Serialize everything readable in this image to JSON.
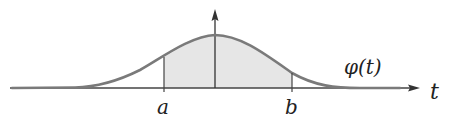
{
  "diagram": {
    "labels": {
      "a": "a",
      "b": "b",
      "function": "φ(t)",
      "axis": "t"
    },
    "colors": {
      "curve": "#777777",
      "axis": "#333333",
      "shade": "#e6e6e6"
    }
  }
}
